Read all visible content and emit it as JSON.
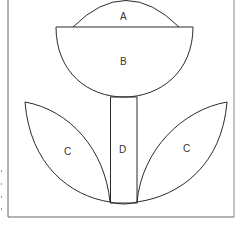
{
  "diagram": {
    "labels": {
      "A": "A",
      "B": "B",
      "C_left": "C",
      "C_right": "C",
      "D": "D"
    },
    "colors": {
      "stroke": "#2a2a2a",
      "frame": "#555555",
      "background": "#ffffff"
    }
  }
}
